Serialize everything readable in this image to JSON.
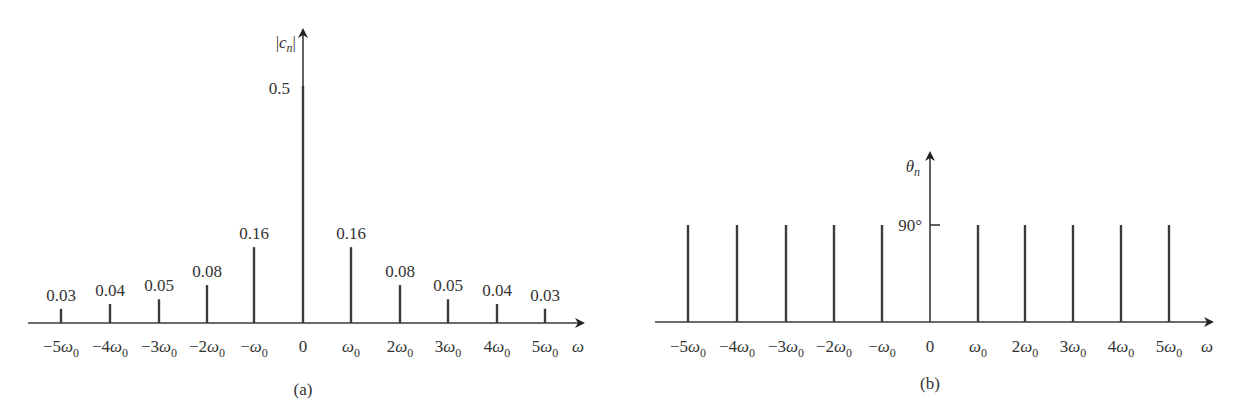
{
  "colors": {
    "stroke": "#3a3a3a",
    "text": "#333333",
    "background": "#ffffff"
  },
  "chart_data": [
    {
      "type": "bar",
      "title": "(a)",
      "xlabel": "ω",
      "ylabel": "|c_n|",
      "categories": [
        "-5ω0",
        "-4ω0",
        "-3ω0",
        "-2ω0",
        "-ω0",
        "0",
        "ω0",
        "2ω0",
        "3ω0",
        "4ω0",
        "5ω0"
      ],
      "values": [
        0.03,
        0.04,
        0.05,
        0.08,
        0.16,
        0.5,
        0.16,
        0.08,
        0.05,
        0.04,
        0.03
      ],
      "value_labels": [
        "0.03",
        "0.04",
        "0.05",
        "0.08",
        "0.16",
        "0.5",
        "0.16",
        "0.08",
        "0.05",
        "0.04",
        "0.03"
      ],
      "grid": false
    },
    {
      "type": "bar",
      "title": "(b)",
      "xlabel": "ω",
      "ylabel": "θ_n",
      "categories": [
        "-5ω0",
        "-4ω0",
        "-3ω0",
        "-2ω0",
        "-ω0",
        "0",
        "ω0",
        "2ω0",
        "3ω0",
        "4ω0",
        "5ω0"
      ],
      "values": [
        90,
        90,
        90,
        90,
        90,
        null,
        90,
        90,
        90,
        90,
        90
      ],
      "yticks": [
        "90°"
      ],
      "grid": false
    }
  ],
  "panel_a": {
    "caption": "(a)",
    "ylabel_main": "|c",
    "ylabel_sub": "n",
    "ylabel_close": "|",
    "xlabel": "ω",
    "ticks": [
      {
        "pre": "−5ω",
        "sub": "0"
      },
      {
        "pre": "−4ω",
        "sub": "0"
      },
      {
        "pre": "−3ω",
        "sub": "0"
      },
      {
        "pre": "−2ω",
        "sub": "0"
      },
      {
        "pre": "−ω",
        "sub": "0"
      },
      {
        "pre": "0",
        "sub": ""
      },
      {
        "pre": "ω",
        "sub": "0"
      },
      {
        "pre": "2ω",
        "sub": "0"
      },
      {
        "pre": "3ω",
        "sub": "0"
      },
      {
        "pre": "4ω",
        "sub": "0"
      },
      {
        "pre": "5ω",
        "sub": "0"
      }
    ]
  },
  "panel_b": {
    "caption": "(b)",
    "ylabel_main": "θ",
    "ylabel_sub": "n",
    "ytick": "90°",
    "xlabel": "ω"
  }
}
